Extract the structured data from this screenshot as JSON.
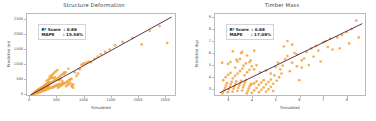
{
  "figure": {
    "width": 376,
    "height": 121,
    "background": "#ffffff",
    "marker_color": "#f2a33c",
    "line_color": "#4a2040",
    "axis_color": "#b9b9c2"
  },
  "chart_data": [
    {
      "type": "scatter",
      "title": "Structure Deformation",
      "xlabel": "Simulated",
      "ylabel": "Predicted (m)",
      "xlim": [
        -60,
        2700
      ],
      "ylim": [
        -60,
        2700
      ],
      "xticks": [
        "0",
        "500",
        "1000",
        "1500",
        "2000",
        "2500"
      ],
      "xtick_values": [
        0,
        500,
        1000,
        1500,
        2000,
        2500
      ],
      "yticks": [
        "0",
        "500",
        "1000",
        "1500",
        "2000",
        "2500"
      ],
      "ytick_values": [
        0,
        500,
        1000,
        1500,
        2000,
        2500
      ],
      "grid": false,
      "legend": "none",
      "annotations": {
        "r2_label": "R² Score  : 0.88",
        "mape_label": "MAPE      : 15.56%",
        "r2_value": 0.88,
        "mape_value": 15.56
      },
      "fit_line": {
        "x": [
          0,
          2600
        ],
        "y": [
          0,
          2600
        ]
      },
      "points": [
        [
          40,
          30
        ],
        [
          55,
          48
        ],
        [
          62,
          40
        ],
        [
          70,
          75
        ],
        [
          78,
          60
        ],
        [
          85,
          92
        ],
        [
          90,
          70
        ],
        [
          95,
          110
        ],
        [
          100,
          85
        ],
        [
          108,
          130
        ],
        [
          112,
          95
        ],
        [
          120,
          145
        ],
        [
          126,
          105
        ],
        [
          133,
          160
        ],
        [
          140,
          120
        ],
        [
          146,
          175
        ],
        [
          152,
          130
        ],
        [
          158,
          190
        ],
        [
          165,
          140
        ],
        [
          170,
          205
        ],
        [
          176,
          150
        ],
        [
          182,
          220
        ],
        [
          188,
          160
        ],
        [
          195,
          235
        ],
        [
          200,
          170
        ],
        [
          207,
          250
        ],
        [
          213,
          180
        ],
        [
          220,
          265
        ],
        [
          226,
          195
        ],
        [
          232,
          280
        ],
        [
          238,
          205
        ],
        [
          245,
          295
        ],
        [
          250,
          215
        ],
        [
          256,
          310
        ],
        [
          262,
          225
        ],
        [
          268,
          325
        ],
        [
          275,
          235
        ],
        [
          280,
          345
        ],
        [
          286,
          250
        ],
        [
          292,
          360
        ],
        [
          298,
          260
        ],
        [
          305,
          375
        ],
        [
          310,
          270
        ],
        [
          316,
          390
        ],
        [
          322,
          285
        ],
        [
          328,
          405
        ],
        [
          334,
          295
        ],
        [
          340,
          420
        ],
        [
          346,
          305
        ],
        [
          352,
          435
        ],
        [
          120,
          60
        ],
        [
          150,
          80
        ],
        [
          180,
          100
        ],
        [
          210,
          120
        ],
        [
          240,
          140
        ],
        [
          270,
          160
        ],
        [
          300,
          185
        ],
        [
          330,
          205
        ],
        [
          360,
          230
        ],
        [
          390,
          250
        ],
        [
          420,
          275
        ],
        [
          450,
          295
        ],
        [
          480,
          320
        ],
        [
          510,
          340
        ],
        [
          540,
          365
        ],
        [
          570,
          385
        ],
        [
          600,
          410
        ],
        [
          130,
          170
        ],
        [
          160,
          200
        ],
        [
          190,
          230
        ],
        [
          220,
          260
        ],
        [
          250,
          290
        ],
        [
          280,
          320
        ],
        [
          310,
          350
        ],
        [
          340,
          380
        ],
        [
          370,
          410
        ],
        [
          400,
          440
        ],
        [
          430,
          470
        ],
        [
          460,
          500
        ],
        [
          360,
          620
        ],
        [
          390,
          660
        ],
        [
          415,
          700
        ],
        [
          440,
          745
        ],
        [
          470,
          790
        ],
        [
          500,
          835
        ],
        [
          530,
          500
        ],
        [
          560,
          540
        ],
        [
          590,
          470
        ],
        [
          620,
          700
        ],
        [
          650,
          760
        ],
        [
          680,
          430
        ],
        [
          700,
          880
        ],
        [
          730,
          520
        ],
        [
          760,
          330
        ],
        [
          790,
          360
        ],
        [
          820,
          760
        ],
        [
          850,
          640
        ],
        [
          880,
          720
        ],
        [
          910,
          860
        ],
        [
          940,
          1010
        ],
        [
          970,
          1040
        ],
        [
          1000,
          1060
        ],
        [
          1040,
          1090
        ],
        [
          1080,
          1120
        ],
        [
          1120,
          1100
        ],
        [
          1180,
          1210
        ],
        [
          1240,
          1280
        ],
        [
          1300,
          1360
        ],
        [
          1380,
          1440
        ],
        [
          1460,
          1520
        ],
        [
          1560,
          1660
        ],
        [
          1700,
          1770
        ],
        [
          1880,
          1900
        ],
        [
          2050,
          1690
        ],
        [
          2200,
          2140
        ],
        [
          2380,
          2300
        ],
        [
          2520,
          1740
        ],
        [
          300,
          480
        ],
        [
          330,
          510
        ],
        [
          355,
          540
        ],
        [
          380,
          570
        ],
        [
          405,
          600
        ],
        [
          430,
          560
        ],
        [
          455,
          590
        ],
        [
          480,
          520
        ],
        [
          505,
          560
        ],
        [
          530,
          600
        ],
        [
          555,
          640
        ],
        [
          580,
          680
        ],
        [
          605,
          720
        ],
        [
          630,
          760
        ],
        [
          660,
          300
        ],
        [
          690,
          340
        ],
        [
          715,
          380
        ],
        [
          740,
          410
        ],
        [
          765,
          290
        ],
        [
          790,
          250
        ],
        [
          410,
          250
        ],
        [
          435,
          280
        ],
        [
          460,
          310
        ],
        [
          485,
          340
        ],
        [
          510,
          250
        ],
        [
          535,
          280
        ],
        [
          560,
          310
        ],
        [
          585,
          340
        ],
        [
          610,
          370
        ],
        [
          635,
          400
        ],
        [
          660,
          430
        ],
        [
          685,
          460
        ],
        [
          710,
          490
        ],
        [
          735,
          520
        ],
        [
          760,
          550
        ]
      ]
    },
    {
      "type": "scatter",
      "title": "Timber Mass",
      "xlabel": "Simulated",
      "ylabel": "Predicted (kg)",
      "xlim": [
        2.4,
        8.8
      ],
      "ylim": [
        2.4,
        9.3
      ],
      "xticks": [
        "3",
        "4",
        "5",
        "6",
        "7",
        "8"
      ],
      "xtick_values": [
        3,
        4,
        5,
        6,
        7,
        8
      ],
      "yticks": [
        "3",
        "4",
        "5",
        "6",
        "7",
        "8",
        "9"
      ],
      "ytick_values": [
        3,
        4,
        5,
        6,
        7,
        8,
        9
      ],
      "grid": false,
      "legend": "none",
      "annotations": {
        "r2_label": "R² Score  : 0.68",
        "mape_label": "MAPE      : 17.08%",
        "r2_value": 0.68,
        "mape_value": 17.08
      },
      "fit_line": {
        "x": [
          2.6,
          8.6
        ],
        "y": [
          2.75,
          8.5
        ]
      },
      "points": [
        [
          2.72,
          2.7
        ],
        [
          2.78,
          2.95
        ],
        [
          2.82,
          3.15
        ],
        [
          2.86,
          3.35
        ],
        [
          2.9,
          3.55
        ],
        [
          2.94,
          2.8
        ],
        [
          2.98,
          3.05
        ],
        [
          3.02,
          3.25
        ],
        [
          3.06,
          3.45
        ],
        [
          3.1,
          3.65
        ],
        [
          3.14,
          2.85
        ],
        [
          3.18,
          3.1
        ],
        [
          3.22,
          3.3
        ],
        [
          3.26,
          3.5
        ],
        [
          3.3,
          3.7
        ],
        [
          3.34,
          2.9
        ],
        [
          3.38,
          3.15
        ],
        [
          3.42,
          3.35
        ],
        [
          3.46,
          3.55
        ],
        [
          3.5,
          3.75
        ],
        [
          3.54,
          2.95
        ],
        [
          3.58,
          3.2
        ],
        [
          3.62,
          3.4
        ],
        [
          3.66,
          3.6
        ],
        [
          3.7,
          3.8
        ],
        [
          3.74,
          2.7
        ],
        [
          3.78,
          2.9
        ],
        [
          3.82,
          3.1
        ],
        [
          3.86,
          3.3
        ],
        [
          3.9,
          3.5
        ],
        [
          2.75,
          3.8
        ],
        [
          2.85,
          4.05
        ],
        [
          2.95,
          4.25
        ],
        [
          3.05,
          4.4
        ],
        [
          3.15,
          3.95
        ],
        [
          3.25,
          4.15
        ],
        [
          3.35,
          4.35
        ],
        [
          3.45,
          4.55
        ],
        [
          3.55,
          4.75
        ],
        [
          3.65,
          4.2
        ],
        [
          3.75,
          4.45
        ],
        [
          3.85,
          4.65
        ],
        [
          3.95,
          2.75
        ],
        [
          4.05,
          2.95
        ],
        [
          4.15,
          3.15
        ],
        [
          4.25,
          2.8
        ],
        [
          4.35,
          3.0
        ],
        [
          4.45,
          3.2
        ],
        [
          4.55,
          2.85
        ],
        [
          4.65,
          3.05
        ],
        [
          4.75,
          3.25
        ],
        [
          4.85,
          2.9
        ],
        [
          3.95,
          3.45
        ],
        [
          4.05,
          3.55
        ],
        [
          4.15,
          3.7
        ],
        [
          4.25,
          3.4
        ],
        [
          4.35,
          3.6
        ],
        [
          4.45,
          3.8
        ],
        [
          4.55,
          3.45
        ],
        [
          4.65,
          3.65
        ],
        [
          4.75,
          3.85
        ],
        [
          4.85,
          3.5
        ],
        [
          2.7,
          5.25
        ],
        [
          3.05,
          5.3
        ],
        [
          3.35,
          5.35
        ],
        [
          3.5,
          6.05
        ],
        [
          3.55,
          6.15
        ],
        [
          3.25,
          4.85
        ],
        [
          3.6,
          5.0
        ],
        [
          3.7,
          5.2
        ],
        [
          3.85,
          5.3
        ],
        [
          3.95,
          4.95
        ],
        [
          4.05,
          4.7
        ],
        [
          4.15,
          5.05
        ],
        [
          3.3,
          5.5
        ],
        [
          3.45,
          5.55
        ],
        [
          3.9,
          5.45
        ],
        [
          4.3,
          4.45
        ],
        [
          4.55,
          4.6
        ],
        [
          4.75,
          4.35
        ],
        [
          4.95,
          4.9
        ],
        [
          5.05,
          5.25
        ],
        [
          5.15,
          4.7
        ],
        [
          5.25,
          5.0
        ],
        [
          4.9,
          4.2
        ],
        [
          5.0,
          3.75
        ],
        [
          5.1,
          4.05
        ],
        [
          5.2,
          4.35
        ],
        [
          5.35,
          5.55
        ],
        [
          5.45,
          5.8
        ],
        [
          5.55,
          4.55
        ],
        [
          5.65,
          5.25
        ],
        [
          5.75,
          6.05
        ],
        [
          5.85,
          5.95
        ],
        [
          5.95,
          3.8
        ],
        [
          6.05,
          4.85
        ],
        [
          6.15,
          5.6
        ],
        [
          6.25,
          6.15
        ],
        [
          6.35,
          5.05
        ],
        [
          6.45,
          6.45
        ],
        [
          6.55,
          5.75
        ],
        [
          6.65,
          6.65
        ],
        [
          6.75,
          6.25
        ],
        [
          6.85,
          5.35
        ],
        [
          6.95,
          6.95
        ],
        [
          7.05,
          7.05
        ],
        [
          7.15,
          6.55
        ],
        [
          7.25,
          7.25
        ],
        [
          5.45,
          7.05
        ],
        [
          5.65,
          6.75
        ],
        [
          5.3,
          6.6
        ],
        [
          7.35,
          6.35
        ],
        [
          7.55,
          7.35
        ],
        [
          7.75,
          7.55
        ],
        [
          7.95,
          7.8
        ],
        [
          8.15,
          8.05
        ],
        [
          8.35,
          8.75
        ],
        [
          8.45,
          7.35
        ],
        [
          8.05,
          6.85
        ],
        [
          7.65,
          6.45
        ],
        [
          4.05,
          6.25
        ],
        [
          3.75,
          5.85
        ],
        [
          3.15,
          6.2
        ],
        [
          2.95,
          5.15
        ],
        [
          5.85,
          4.95
        ],
        [
          6.05,
          5.45
        ]
      ]
    }
  ]
}
